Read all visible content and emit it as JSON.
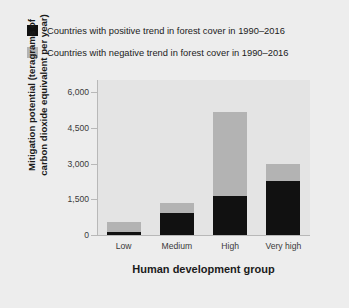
{
  "chart_data": {
    "type": "bar",
    "subtype": "stacked",
    "title": "",
    "xlabel": "Human development group",
    "ylabel": "Mitigation potential (teragrams of carbon dioxide equivalent per year)",
    "categories": [
      "Low",
      "Medium",
      "High",
      "Very high"
    ],
    "series": [
      {
        "name": "Countries with positive trend in forest cover in 1990–2016",
        "color": "#111111",
        "values": [
          125,
          920,
          1635,
          2265
        ]
      },
      {
        "name": "Countries with negative trend in forest cover in 1990–2016",
        "color": "#b3b3b3",
        "values": [
          420,
          420,
          3525,
          715
        ]
      }
    ],
    "totals": [
      545,
      1340,
      5160,
      2980
    ],
    "ylim": [
      0,
      6000
    ],
    "yticks": [
      0,
      1500,
      3000,
      4500,
      6000
    ],
    "ytick_labels": [
      "0",
      "1,500",
      "3,000",
      "4,500",
      "6,000"
    ],
    "grid": false,
    "legend_position": "top-left",
    "panel_background": "#e4e4e4",
    "figure_background": "#ededed",
    "axis_color": "#b8b8b8"
  },
  "legend": {
    "items": [
      {
        "label": "Countries with positive trend in forest cover in 1990–2016",
        "color": "#111111"
      },
      {
        "label": "Countries with negative trend in forest cover in 1990–2016",
        "color": "#b3b3b3"
      }
    ]
  }
}
